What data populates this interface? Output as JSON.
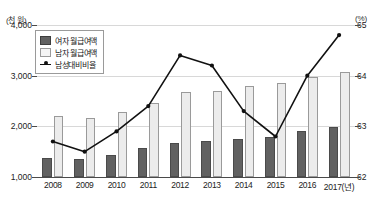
{
  "axes": {
    "left_unit": "(천 원)",
    "right_unit": "(%)",
    "left_ticks": [
      "4,000",
      "3,000",
      "2,000",
      "1,000"
    ],
    "right_ticks": [
      "65",
      "64",
      "63",
      "62"
    ]
  },
  "legend": {
    "items": [
      {
        "label": "여자 월급여액",
        "icon": "dark-square-swatch",
        "color": "#616161"
      },
      {
        "label": "남자 월급여액",
        "icon": "light-square-swatch",
        "color": "#ececec"
      },
      {
        "label": "남성대비비율",
        "icon": "line-marker-swatch",
        "color": "#111111"
      }
    ]
  },
  "chart_data": {
    "type": "bar",
    "title": "",
    "subtitle": "",
    "xlabel": "",
    "ylabel": "천 원",
    "categories": [
      "2008",
      "2009",
      "2010",
      "2011",
      "2012",
      "2013",
      "2014",
      "2015",
      "2016",
      "2017(년)"
    ],
    "ylim": [
      1000,
      4000
    ],
    "y2lim": [
      62,
      65
    ],
    "grid": true,
    "legend_position": "top-left",
    "series": [
      {
        "name": "여자 월급여액",
        "type": "bar",
        "axis": "left",
        "unit": "천 원",
        "color": "#616161",
        "values": [
          1380,
          1360,
          1440,
          1570,
          1680,
          1720,
          1760,
          1800,
          1900,
          1990
        ]
      },
      {
        "name": "남자 월급여액",
        "type": "bar",
        "axis": "left",
        "unit": "천 원",
        "color": "#ececec",
        "values": [
          2200,
          2170,
          2290,
          2470,
          2670,
          2700,
          2790,
          2860,
          2970,
          3080
        ]
      },
      {
        "name": "남성대비비율",
        "type": "line",
        "axis": "right",
        "unit": "%",
        "color": "#111111",
        "values": [
          62.7,
          62.5,
          62.9,
          63.4,
          64.4,
          64.2,
          63.3,
          62.8,
          64.0,
          64.8
        ]
      }
    ]
  }
}
